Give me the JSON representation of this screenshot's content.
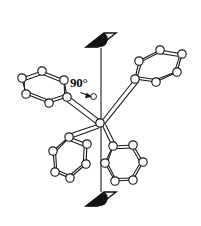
{
  "figure": {
    "name": "molecular-structure-diagram",
    "background_color": "#ffffff",
    "stroke_color": "#1a1a1a",
    "atom_fill_color": "#ffffff",
    "symmetry_symbol_fill": "#000000",
    "width": 201,
    "height": 226
  },
  "annotation": {
    "angle_label": "90°",
    "angle_value": 90,
    "angle_unit": "degrees",
    "arrow_name": "angle-pointer-arrow"
  },
  "axis": {
    "name": "two-fold-rotation-axis",
    "label": "",
    "x": 101,
    "y_top": 48,
    "y_bottom": 192,
    "top_symbol": "two-fold-axis-lens-symbol",
    "bottom_symbol": "two-fold-axis-lens-symbol"
  },
  "center_atom": {
    "name": "central-atom",
    "label": "",
    "cx": 100,
    "cy": 123,
    "r": 4.2
  },
  "rings": [
    {
      "name": "phenyl-ring-upper-left",
      "label": "",
      "vertices": [
        [
          22,
          78
        ],
        [
          42,
          71
        ],
        [
          64,
          80
        ],
        [
          67,
          97
        ],
        [
          49,
          103
        ],
        [
          26,
          94
        ]
      ],
      "ipso_index": 3
    },
    {
      "name": "phenyl-ring-upper-right",
      "label": "",
      "vertices": [
        [
          160,
          50
        ],
        [
          182,
          54
        ],
        [
          177,
          72
        ],
        [
          156,
          82
        ],
        [
          135,
          79
        ],
        [
          139,
          61
        ]
      ],
      "ipso_index": 4
    },
    {
      "name": "phenyl-ring-lower-left",
      "label": "",
      "vertices": [
        [
          69,
          137
        ],
        [
          87,
          144
        ],
        [
          86,
          164
        ],
        [
          70,
          178
        ],
        [
          55,
          172
        ],
        [
          53,
          151
        ]
      ],
      "ipso_index": 0
    },
    {
      "name": "phenyl-ring-lower-right",
      "label": "",
      "vertices": [
        [
          113,
          146
        ],
        [
          133,
          145
        ],
        [
          143,
          162
        ],
        [
          133,
          180
        ],
        [
          115,
          181
        ],
        [
          105,
          163
        ]
      ],
      "ipso_index": 0
    }
  ],
  "bonds_to_center": [
    {
      "name": "bond-center-to-upper-left",
      "from": [
        100,
        123
      ],
      "to": [
        67,
        97
      ]
    },
    {
      "name": "bond-center-to-upper-right",
      "from": [
        100,
        123
      ],
      "to": [
        135,
        79
      ]
    },
    {
      "name": "bond-center-to-lower-left",
      "from": [
        100,
        123
      ],
      "to": [
        69,
        137
      ]
    },
    {
      "name": "bond-center-to-lower-right",
      "from": [
        100,
        123
      ],
      "to": [
        113,
        146
      ]
    }
  ]
}
